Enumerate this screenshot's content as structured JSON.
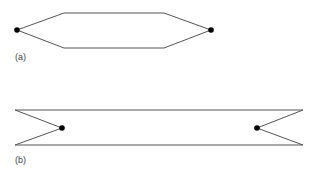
{
  "figures": [
    {
      "label": "(a)",
      "shape": "elongated hexagon with endpoints",
      "points": [
        [
          17,
          30
        ],
        [
          64,
          13
        ],
        [
          164,
          13
        ],
        [
          211,
          30
        ],
        [
          164,
          48
        ],
        [
          64,
          48
        ]
      ],
      "nodes": [
        [
          17,
          30
        ],
        [
          211,
          30
        ]
      ]
    },
    {
      "label": "(b)",
      "shape": "band with inward notches at both ends",
      "points": [
        [
          15,
          110
        ],
        [
          303,
          110
        ],
        [
          257,
          128
        ],
        [
          303,
          145
        ],
        [
          15,
          145
        ],
        [
          62,
          128
        ]
      ],
      "nodes": [
        [
          62,
          128
        ],
        [
          257,
          128
        ]
      ]
    }
  ],
  "colors": {
    "stroke": "#555555",
    "node": "#000000"
  }
}
